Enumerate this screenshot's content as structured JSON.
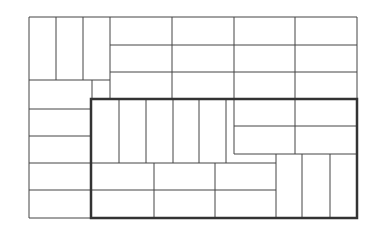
{
  "diagram": {
    "type": "rectangle-tiling",
    "colors": {
      "background": "#ffffff",
      "line": "#444444",
      "highlight_border": "#333333"
    },
    "thin_lines": [
      [
        29,
        17,
        357,
        17
      ],
      [
        29,
        17,
        29,
        218
      ],
      [
        357,
        17,
        357,
        99
      ],
      [
        56,
        17,
        56,
        80
      ],
      [
        83,
        17,
        83,
        80
      ],
      [
        110,
        17,
        110,
        99
      ],
      [
        29,
        80,
        110,
        80
      ],
      [
        92,
        80,
        92,
        99
      ],
      [
        110,
        45,
        357,
        45
      ],
      [
        110,
        72,
        357,
        72
      ],
      [
        172,
        17,
        172,
        99
      ],
      [
        234,
        17,
        234,
        99
      ],
      [
        295,
        17,
        295,
        99
      ],
      [
        29,
        109,
        91,
        109
      ],
      [
        29,
        136,
        91,
        136
      ],
      [
        29,
        163,
        91,
        163
      ],
      [
        29,
        190,
        91,
        190
      ],
      [
        29,
        218,
        91,
        218
      ],
      [
        119,
        99,
        119,
        163
      ],
      [
        146,
        99,
        146,
        163
      ],
      [
        173,
        99,
        173,
        163
      ],
      [
        199,
        99,
        199,
        163
      ],
      [
        226,
        99,
        226,
        163
      ],
      [
        234,
        99,
        234,
        154
      ],
      [
        234,
        154,
        357,
        154
      ],
      [
        234,
        126,
        357,
        126
      ],
      [
        295,
        99,
        295,
        154
      ],
      [
        91,
        163,
        276,
        163
      ],
      [
        91,
        190,
        276,
        190
      ],
      [
        154,
        163,
        154,
        218
      ],
      [
        215,
        163,
        215,
        218
      ],
      [
        276,
        154,
        276,
        218
      ],
      [
        302,
        154,
        302,
        218
      ],
      [
        330,
        154,
        330,
        218
      ]
    ],
    "highlight_box": {
      "x": 91,
      "y": 99,
      "width": 266,
      "height": 119
    }
  }
}
